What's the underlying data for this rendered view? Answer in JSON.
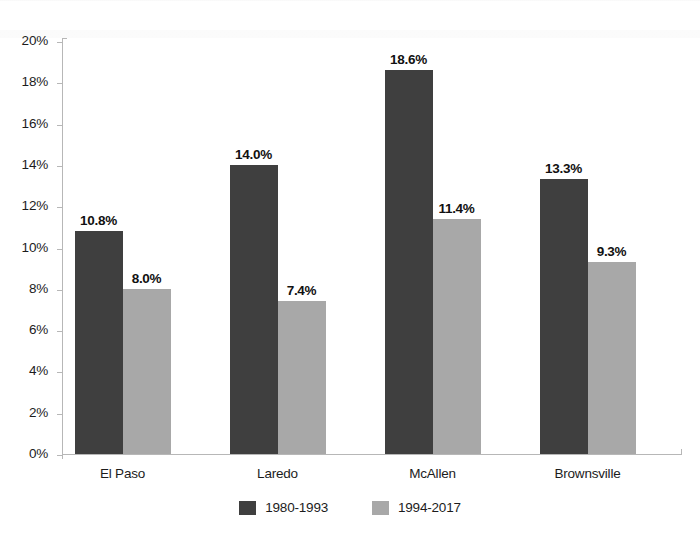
{
  "chart_data": {
    "type": "bar",
    "title": "",
    "subtitle": "",
    "xlabel": "",
    "ylabel": "",
    "categories": [
      "El Paso",
      "Laredo",
      "McAllen",
      "Brownsville"
    ],
    "series": [
      {
        "name": "1980-1993",
        "color": "#3f3f3f",
        "values": [
          10.8,
          14.0,
          18.6,
          13.3
        ],
        "labels": [
          "10.8%",
          "14.0%",
          "18.6%",
          "13.3%"
        ]
      },
      {
        "name": "1994-2017",
        "color": "#a8a8a8",
        "values": [
          8.0,
          7.4,
          11.4,
          9.3
        ],
        "labels": [
          "8.0%",
          "7.4%",
          "11.4%",
          "9.3%"
        ]
      }
    ],
    "ylim": [
      0,
      20
    ],
    "ytick_step": 2,
    "ytick_labels": [
      "0%",
      "2%",
      "4%",
      "6%",
      "8%",
      "10%",
      "12%",
      "14%",
      "16%",
      "18%",
      "20%"
    ],
    "ytick_values": [
      0,
      2,
      4,
      6,
      8,
      10,
      12,
      14,
      16,
      18,
      20
    ],
    "grid": false,
    "legend_position": "bottom",
    "annotations": []
  },
  "legend": {
    "items": [
      {
        "label": "1980-1993"
      },
      {
        "label": "1994-2017"
      }
    ]
  }
}
